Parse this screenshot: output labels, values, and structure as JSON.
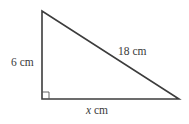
{
  "diagram": {
    "type": "right-triangle",
    "vertices": {
      "top": [
        42,
        11
      ],
      "right_angle": [
        42,
        99
      ],
      "right": [
        179,
        99
      ]
    },
    "right_angle_marker_size": 7,
    "stroke_color": "#3c3c3c",
    "labels": {
      "vertical_side": "6 cm",
      "hypotenuse": "18 cm",
      "horizontal_side_var": "x",
      "horizontal_side_unit": " cm"
    }
  }
}
